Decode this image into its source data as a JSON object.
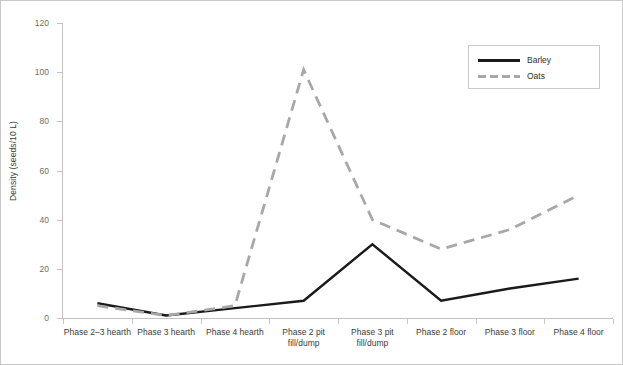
{
  "chart_data": {
    "type": "line",
    "title": "",
    "xlabel": "",
    "ylabel": "Density (seeds/10 L)",
    "ylim": [
      0,
      120
    ],
    "ytick_values": [
      0,
      20,
      40,
      60,
      80,
      100,
      120
    ],
    "ytick_labels": [
      "0",
      "20",
      "40",
      "60",
      "80",
      "100",
      "120"
    ],
    "grid": false,
    "legend_position": "top-right",
    "categories": [
      "Phase 2–3 hearth",
      "Phase 3 hearth",
      "Phase 4 hearth",
      "Phase 2 pit fill/dump",
      "Phase 3 pit fill/dump",
      "Phase 2 floor",
      "Phase 3 floor",
      "Phase 4 floor"
    ],
    "category_lines": [
      [
        "Phase 2–3 hearth"
      ],
      [
        "Phase 3 hearth"
      ],
      [
        "Phase 4 hearth"
      ],
      [
        "Phase 2 pit",
        "fill/dump"
      ],
      [
        "Phase 3 pit",
        "fill/dump"
      ],
      [
        "Phase 2 floor"
      ],
      [
        "Phase 3 floor"
      ],
      [
        "Phase 4 floor"
      ]
    ],
    "series": [
      {
        "name": "Barley",
        "color": "#1a1a1a",
        "style": "solid",
        "values": [
          6,
          1,
          4,
          7,
          30,
          7,
          12,
          16
        ]
      },
      {
        "name": "Oats",
        "color": "#a8a8a8",
        "style": "dashed",
        "values": [
          5,
          1,
          5,
          101,
          40,
          28,
          36,
          50
        ]
      }
    ]
  },
  "legend": {
    "entries": [
      {
        "label": "Barley"
      },
      {
        "label": "Oats"
      }
    ]
  }
}
